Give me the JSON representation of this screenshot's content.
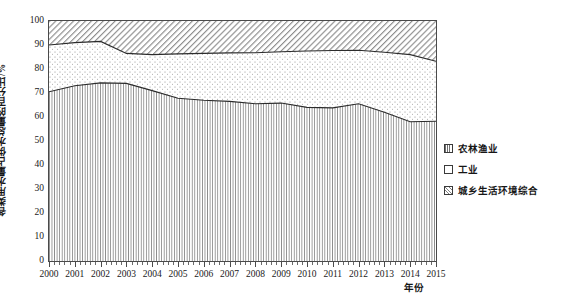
{
  "chart_data": {
    "type": "area",
    "title": "",
    "subtitle": "",
    "xlabel": "年份",
    "ylabel": "各类用水量占供水总量的百分比/%",
    "stacked": true,
    "percent_stacked": true,
    "grid": false,
    "legend_position": "right",
    "xlim": [
      2000,
      2015
    ],
    "ylim": [
      0,
      100
    ],
    "y_ticks": [
      0,
      10,
      20,
      30,
      40,
      50,
      60,
      70,
      80,
      90,
      100
    ],
    "x_minor_tick_count_between_years": 4,
    "categories": [
      2000,
      2001,
      2002,
      2003,
      2004,
      2005,
      2006,
      2007,
      2008,
      2009,
      2010,
      2011,
      2012,
      2013,
      2014,
      2015
    ],
    "x_tick_labels": [
      "2000",
      "2001",
      "2002",
      "2003",
      "2004",
      "2005",
      "2006",
      "2007",
      "2008",
      "2009",
      "2010",
      "2011",
      "2012",
      "2013",
      "2014",
      "2015"
    ],
    "series": [
      {
        "name": "农林渔业",
        "pattern": "vertical-lines",
        "values": [
          70.5,
          73.0,
          74.2,
          74.0,
          71.0,
          67.8,
          67.0,
          66.5,
          65.5,
          65.8,
          64.0,
          63.8,
          65.5,
          62.0,
          58.0,
          58.2
        ]
      },
      {
        "name": "工业",
        "pattern": "dots",
        "values": [
          19.5,
          18.0,
          17.3,
          12.5,
          15.0,
          18.5,
          19.5,
          20.2,
          21.3,
          21.4,
          23.5,
          23.9,
          22.3,
          25.0,
          28.0,
          25.0
        ]
      },
      {
        "name": "城乡生活环境综合",
        "pattern": "diagonal-hatch",
        "values": [
          10.0,
          9.0,
          8.5,
          13.5,
          14.0,
          13.7,
          13.5,
          13.3,
          13.2,
          12.8,
          12.5,
          12.3,
          12.2,
          13.0,
          14.0,
          16.8
        ]
      }
    ],
    "boundaries": {
      "agriculture_top": [
        70.5,
        73.0,
        74.2,
        74.0,
        71.0,
        67.8,
        67.0,
        66.5,
        65.5,
        65.8,
        64.0,
        63.8,
        65.5,
        62.0,
        58.0,
        58.2
      ],
      "industry_top": [
        90.0,
        91.0,
        91.5,
        86.5,
        86.0,
        86.3,
        86.5,
        86.7,
        86.8,
        87.2,
        87.5,
        87.7,
        87.8,
        87.0,
        86.0,
        83.2
      ]
    },
    "annotations": []
  },
  "legend": {
    "items": [
      {
        "label": "农林渔业",
        "pattern": "vertical-lines"
      },
      {
        "label": "工业",
        "pattern": "dots"
      },
      {
        "label": "城乡生活环境综合",
        "pattern": "diagonal-hatch"
      }
    ]
  },
  "colors": {
    "axis": "#4a4a4a",
    "line": "#2b2b2b",
    "background": "#ffffff",
    "pattern_gray": "#707070"
  }
}
